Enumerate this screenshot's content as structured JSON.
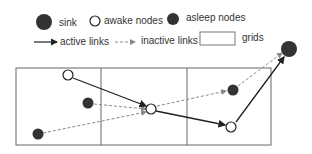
{
  "legend": {
    "sink": "sink",
    "awake": "awake nodes",
    "asleep": "asleep nodes",
    "active": "active links",
    "inactive": "inactive links",
    "grids": "grids"
  },
  "colors": {
    "node_fill": "#333333",
    "line": "#222222",
    "dashed": "#888888",
    "grid": "#555555"
  }
}
